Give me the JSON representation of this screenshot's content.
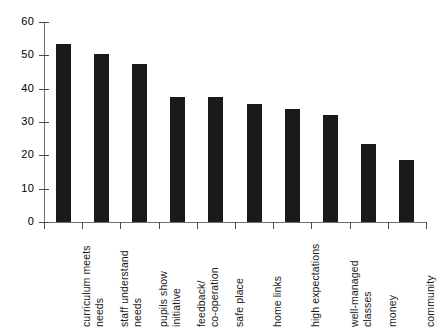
{
  "chart_data": {
    "type": "bar",
    "title": "",
    "subtitle": "",
    "xlabel": "",
    "ylabel": "",
    "ylim": [
      0,
      60
    ],
    "xlim_note": "categorical",
    "grid": false,
    "legend": "none",
    "orientation": "vertical",
    "bar_color": "#1a1a1a",
    "axis_color": "#6e6e6e",
    "background": "#ffffff",
    "y_ticks": [
      0,
      10,
      20,
      30,
      40,
      50,
      60
    ],
    "y_tick_labels": [
      "0",
      "10",
      "20",
      "30",
      "40",
      "50",
      "60"
    ],
    "categories": [
      "curriculum meets needs",
      "staff understand needs",
      "pupils show initiative",
      "feedback/ co-operation",
      "safe place",
      "home links",
      "high expectations",
      "well-managed classes",
      "money",
      "community"
    ],
    "category_lines": [
      [
        "curriculum meets",
        "needs"
      ],
      [
        "staff understand",
        "needs"
      ],
      [
        "pupils show",
        "initiative"
      ],
      [
        "feedback/",
        "co-operation"
      ],
      [
        "safe place"
      ],
      [
        "home links"
      ],
      [
        "high expectations"
      ],
      [
        "well-managed",
        "classes"
      ],
      [
        "money"
      ],
      [
        "community"
      ]
    ],
    "values": [
      53.5,
      50.5,
      47.5,
      37.5,
      37.5,
      35.5,
      34,
      32,
      23.5,
      18.5
    ]
  }
}
